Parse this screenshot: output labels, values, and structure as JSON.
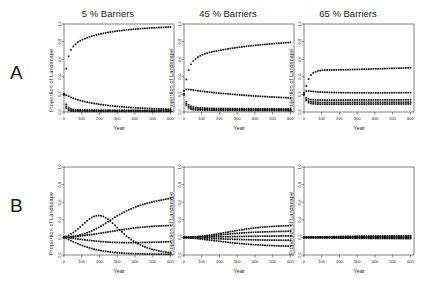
{
  "figure": {
    "rows": [
      {
        "letter": "A"
      },
      {
        "letter": "B"
      }
    ],
    "column_titles": [
      "5 % Barriers",
      "45 % Barriers",
      "65 % Barriers"
    ],
    "axis": {
      "ylabel": "Proportion of Landscape",
      "xlabel": "Year",
      "xticks": [
        "0",
        "100",
        "200",
        "300",
        "400",
        "500",
        "600"
      ],
      "yticks": [
        "0.0",
        "0.2",
        "0.4",
        "0.6",
        "0.8",
        "1.0"
      ]
    }
  },
  "chart_data": [
    {
      "type": "line",
      "panel": "A1",
      "title": "5 % Barriers",
      "xlabel": "Year",
      "ylabel": "Proportion of Landscape",
      "xlim": [
        0,
        620
      ],
      "ylim": [
        0,
        1.0
      ],
      "grid": false,
      "legend": "none",
      "x": [
        0,
        10,
        20,
        30,
        40,
        50,
        75,
        100,
        125,
        150,
        175,
        200,
        250,
        300,
        350,
        400,
        450,
        500,
        550,
        600
      ],
      "series": [
        {
          "name": "state-1",
          "values": [
            0.2,
            0.45,
            0.59,
            0.66,
            0.71,
            0.74,
            0.79,
            0.82,
            0.84,
            0.86,
            0.87,
            0.885,
            0.905,
            0.92,
            0.932,
            0.942,
            0.95,
            0.956,
            0.961,
            0.965
          ]
        },
        {
          "name": "state-2",
          "values": [
            0.2,
            0.195,
            0.185,
            0.175,
            0.165,
            0.158,
            0.14,
            0.126,
            0.114,
            0.104,
            0.095,
            0.087,
            0.074,
            0.064,
            0.055,
            0.048,
            0.043,
            0.038,
            0.034,
            0.031
          ]
        },
        {
          "name": "state-3",
          "values": [
            0.2,
            0.1,
            0.055,
            0.04,
            0.033,
            0.029,
            0.025,
            0.023,
            0.022,
            0.021,
            0.021,
            0.02,
            0.02,
            0.019,
            0.019,
            0.019,
            0.018,
            0.018,
            0.018,
            0.018
          ]
        },
        {
          "name": "state-4",
          "values": [
            0.2,
            0.075,
            0.035,
            0.024,
            0.019,
            0.017,
            0.015,
            0.014,
            0.014,
            0.013,
            0.013,
            0.013,
            0.012,
            0.012,
            0.012,
            0.012,
            0.012,
            0.011,
            0.011,
            0.011
          ]
        },
        {
          "name": "state-5",
          "values": [
            0.2,
            0.055,
            0.022,
            0.013,
            0.01,
            0.009,
            0.008,
            0.007,
            0.007,
            0.007,
            0.007,
            0.006,
            0.006,
            0.006,
            0.006,
            0.006,
            0.006,
            0.005,
            0.005,
            0.005
          ]
        }
      ]
    },
    {
      "type": "line",
      "panel": "A2",
      "title": "45 % Barriers",
      "xlabel": "Year",
      "ylabel": "Proportion of Landscape",
      "xlim": [
        0,
        620
      ],
      "ylim": [
        0,
        1.0
      ],
      "grid": false,
      "legend": "none",
      "x": [
        0,
        10,
        20,
        30,
        40,
        50,
        75,
        100,
        125,
        150,
        175,
        200,
        250,
        300,
        350,
        400,
        450,
        500,
        550,
        600
      ],
      "series": [
        {
          "name": "state-1",
          "values": [
            0.2,
            0.34,
            0.44,
            0.5,
            0.545,
            0.575,
            0.62,
            0.648,
            0.666,
            0.68,
            0.69,
            0.7,
            0.718,
            0.733,
            0.746,
            0.757,
            0.767,
            0.776,
            0.784,
            0.791
          ]
        },
        {
          "name": "state-2",
          "values": [
            0.24,
            0.255,
            0.258,
            0.256,
            0.253,
            0.25,
            0.243,
            0.236,
            0.23,
            0.224,
            0.219,
            0.214,
            0.205,
            0.197,
            0.189,
            0.182,
            0.176,
            0.17,
            0.165,
            0.16
          ]
        },
        {
          "name": "state-3",
          "values": [
            0.2,
            0.128,
            0.092,
            0.074,
            0.064,
            0.058,
            0.049,
            0.045,
            0.043,
            0.041,
            0.04,
            0.04,
            0.039,
            0.038,
            0.038,
            0.037,
            0.037,
            0.037,
            0.036,
            0.036
          ]
        },
        {
          "name": "state-4",
          "values": [
            0.2,
            0.105,
            0.068,
            0.052,
            0.044,
            0.039,
            0.033,
            0.03,
            0.029,
            0.028,
            0.027,
            0.027,
            0.026,
            0.026,
            0.025,
            0.025,
            0.025,
            0.025,
            0.024,
            0.024
          ]
        },
        {
          "name": "state-5",
          "values": [
            0.2,
            0.085,
            0.05,
            0.037,
            0.031,
            0.027,
            0.023,
            0.021,
            0.02,
            0.019,
            0.019,
            0.018,
            0.018,
            0.018,
            0.017,
            0.017,
            0.017,
            0.017,
            0.016,
            0.016
          ]
        }
      ]
    },
    {
      "type": "line",
      "panel": "A3",
      "title": "65 % Barriers",
      "xlabel": "Year",
      "ylabel": "Proportion of Landscape",
      "xlim": [
        0,
        620
      ],
      "ylim": [
        0,
        1.0
      ],
      "grid": false,
      "legend": "none",
      "x": [
        0,
        10,
        20,
        30,
        40,
        50,
        75,
        100,
        125,
        150,
        175,
        200,
        250,
        300,
        350,
        400,
        450,
        500,
        550,
        600
      ],
      "series": [
        {
          "name": "state-1",
          "values": [
            0.2,
            0.275,
            0.345,
            0.392,
            0.423,
            0.443,
            0.466,
            0.474,
            0.476,
            0.477,
            0.478,
            0.479,
            0.481,
            0.484,
            0.487,
            0.49,
            0.493,
            0.496,
            0.499,
            0.502
          ]
        },
        {
          "name": "state-2",
          "values": [
            0.22,
            0.238,
            0.24,
            0.238,
            0.236,
            0.234,
            0.229,
            0.226,
            0.224,
            0.222,
            0.221,
            0.22,
            0.219,
            0.218,
            0.218,
            0.218,
            0.218,
            0.219,
            0.219,
            0.22
          ]
        },
        {
          "name": "state-3",
          "values": [
            0.2,
            0.168,
            0.152,
            0.145,
            0.141,
            0.139,
            0.137,
            0.136,
            0.136,
            0.136,
            0.136,
            0.136,
            0.136,
            0.137,
            0.137,
            0.137,
            0.138,
            0.138,
            0.138,
            0.139
          ]
        },
        {
          "name": "state-4",
          "values": [
            0.2,
            0.152,
            0.13,
            0.12,
            0.115,
            0.113,
            0.11,
            0.109,
            0.109,
            0.109,
            0.109,
            0.109,
            0.109,
            0.11,
            0.11,
            0.11,
            0.11,
            0.111,
            0.111,
            0.111
          ]
        },
        {
          "name": "state-5",
          "values": [
            0.2,
            0.138,
            0.112,
            0.101,
            0.096,
            0.093,
            0.09,
            0.089,
            0.089,
            0.089,
            0.089,
            0.089,
            0.089,
            0.089,
            0.09,
            0.09,
            0.09,
            0.09,
            0.091,
            0.091
          ]
        }
      ]
    },
    {
      "type": "line",
      "panel": "B1",
      "title": "5 % Barriers",
      "xlabel": "Year",
      "ylabel": "Proportion of Landscape",
      "xlim": [
        0,
        620
      ],
      "ylim": [
        0,
        1.0
      ],
      "grid": false,
      "legend": "none",
      "x": [
        0,
        25,
        50,
        75,
        100,
        125,
        150,
        175,
        200,
        225,
        250,
        275,
        300,
        350,
        400,
        450,
        500,
        550,
        600
      ],
      "series": [
        {
          "name": "state-1",
          "values": [
            0.2,
            0.205,
            0.212,
            0.22,
            0.232,
            0.248,
            0.268,
            0.292,
            0.318,
            0.348,
            0.38,
            0.414,
            0.446,
            0.5,
            0.545,
            0.578,
            0.604,
            0.625,
            0.645
          ]
        },
        {
          "name": "state-2",
          "values": [
            0.2,
            0.222,
            0.252,
            0.29,
            0.334,
            0.38,
            0.42,
            0.444,
            0.45,
            0.436,
            0.404,
            0.36,
            0.312,
            0.218,
            0.146,
            0.096,
            0.062,
            0.04,
            0.026
          ]
        },
        {
          "name": "state-3",
          "values": [
            0.2,
            0.202,
            0.206,
            0.212,
            0.218,
            0.224,
            0.23,
            0.238,
            0.246,
            0.254,
            0.262,
            0.27,
            0.278,
            0.294,
            0.308,
            0.318,
            0.326,
            0.331,
            0.335
          ]
        },
        {
          "name": "state-4",
          "values": [
            0.2,
            0.196,
            0.19,
            0.183,
            0.176,
            0.17,
            0.164,
            0.159,
            0.154,
            0.15,
            0.147,
            0.144,
            0.142,
            0.14,
            0.14,
            0.142,
            0.145,
            0.148,
            0.152
          ]
        },
        {
          "name": "state-5",
          "values": [
            0.2,
            0.176,
            0.152,
            0.13,
            0.11,
            0.092,
            0.077,
            0.064,
            0.053,
            0.044,
            0.037,
            0.031,
            0.026,
            0.019,
            0.015,
            0.012,
            0.01,
            0.009,
            0.008
          ]
        }
      ]
    },
    {
      "type": "line",
      "panel": "B2",
      "title": "45 % Barriers",
      "xlabel": "Year",
      "ylabel": "Proportion of Landscape",
      "xlim": [
        0,
        620
      ],
      "ylim": [
        0,
        1.0
      ],
      "grid": false,
      "legend": "none",
      "x": [
        0,
        25,
        50,
        75,
        100,
        125,
        150,
        175,
        200,
        225,
        250,
        275,
        300,
        350,
        400,
        450,
        500,
        550,
        600
      ],
      "series": [
        {
          "name": "state-1",
          "values": [
            0.2,
            0.202,
            0.205,
            0.209,
            0.214,
            0.22,
            0.227,
            0.235,
            0.243,
            0.252,
            0.261,
            0.27,
            0.279,
            0.295,
            0.308,
            0.318,
            0.325,
            0.33,
            0.334
          ]
        },
        {
          "name": "state-2",
          "values": [
            0.2,
            0.201,
            0.203,
            0.206,
            0.209,
            0.213,
            0.217,
            0.222,
            0.227,
            0.232,
            0.237,
            0.242,
            0.246,
            0.254,
            0.259,
            0.263,
            0.266,
            0.268,
            0.27
          ]
        },
        {
          "name": "state-3",
          "values": [
            0.2,
            0.2,
            0.2,
            0.201,
            0.202,
            0.203,
            0.204,
            0.205,
            0.206,
            0.207,
            0.208,
            0.209,
            0.21,
            0.212,
            0.213,
            0.214,
            0.215,
            0.216,
            0.217
          ]
        },
        {
          "name": "state-4",
          "values": [
            0.2,
            0.198,
            0.196,
            0.194,
            0.192,
            0.19,
            0.188,
            0.186,
            0.184,
            0.182,
            0.18,
            0.178,
            0.177,
            0.174,
            0.172,
            0.17,
            0.169,
            0.168,
            0.167
          ]
        },
        {
          "name": "state-5",
          "values": [
            0.2,
            0.196,
            0.191,
            0.186,
            0.18,
            0.174,
            0.168,
            0.162,
            0.156,
            0.15,
            0.144,
            0.138,
            0.133,
            0.124,
            0.117,
            0.111,
            0.107,
            0.103,
            0.1
          ]
        }
      ]
    },
    {
      "type": "line",
      "panel": "B3",
      "title": "65 % Barriers",
      "xlabel": "Year",
      "ylabel": "Proportion of Landscape",
      "xlim": [
        0,
        620
      ],
      "ylim": [
        0,
        1.0
      ],
      "grid": false,
      "legend": "none",
      "x": [
        0,
        25,
        50,
        75,
        100,
        125,
        150,
        175,
        200,
        225,
        250,
        275,
        300,
        350,
        400,
        450,
        500,
        550,
        600
      ],
      "series": [
        {
          "name": "state-1",
          "values": [
            0.2,
            0.201,
            0.203,
            0.204,
            0.206,
            0.207,
            0.208,
            0.209,
            0.21,
            0.211,
            0.212,
            0.213,
            0.214,
            0.215,
            0.216,
            0.217,
            0.218,
            0.219,
            0.22
          ]
        },
        {
          "name": "state-2",
          "values": [
            0.2,
            0.201,
            0.201,
            0.202,
            0.203,
            0.203,
            0.204,
            0.204,
            0.205,
            0.205,
            0.206,
            0.206,
            0.207,
            0.207,
            0.208,
            0.208,
            0.209,
            0.209,
            0.21
          ]
        },
        {
          "name": "state-3",
          "values": [
            0.2,
            0.2,
            0.2,
            0.2,
            0.2,
            0.2,
            0.2,
            0.2,
            0.2,
            0.2,
            0.2,
            0.2,
            0.2,
            0.2,
            0.2,
            0.2,
            0.2,
            0.2,
            0.2
          ]
        },
        {
          "name": "state-4",
          "values": [
            0.2,
            0.199,
            0.199,
            0.198,
            0.198,
            0.197,
            0.197,
            0.196,
            0.196,
            0.195,
            0.195,
            0.194,
            0.194,
            0.193,
            0.193,
            0.192,
            0.192,
            0.191,
            0.191
          ]
        },
        {
          "name": "state-5",
          "values": [
            0.2,
            0.199,
            0.198,
            0.197,
            0.196,
            0.195,
            0.194,
            0.193,
            0.192,
            0.192,
            0.191,
            0.19,
            0.19,
            0.189,
            0.188,
            0.188,
            0.187,
            0.187,
            0.186
          ]
        }
      ]
    }
  ]
}
